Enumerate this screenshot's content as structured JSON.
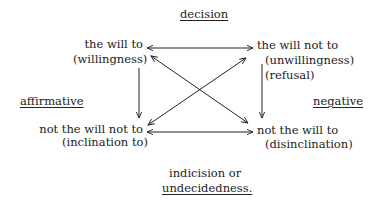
{
  "diagram": {
    "top_label": "decision",
    "left_label": "affirmative",
    "right_label": "negative",
    "bottom_label_line1": "indicision or",
    "bottom_label_line2": "undecidedness.",
    "nodes": {
      "top_left": {
        "line1": "the will to",
        "line2": "(willingness)"
      },
      "top_right": {
        "line1": "the will not to",
        "line2": "(unwillingness)",
        "line3": "(refusal)"
      },
      "bottom_left": {
        "line1": "not the will not to",
        "line2": "(inclination to)"
      },
      "bottom_right": {
        "line1": "not the will to",
        "line2": "(disinclination)"
      }
    },
    "edges": [
      {
        "from": "top_left",
        "to": "top_right",
        "type": "bidirectional"
      },
      {
        "from": "bottom_left",
        "to": "bottom_right",
        "type": "bidirectional"
      },
      {
        "from": "top_left",
        "to": "bottom_left",
        "type": "directed"
      },
      {
        "from": "top_right",
        "to": "bottom_right",
        "type": "directed"
      },
      {
        "from": "top_left",
        "to": "bottom_right",
        "type": "bidirectional"
      },
      {
        "from": "bottom_left",
        "to": "top_right",
        "type": "bidirectional"
      }
    ],
    "colors": {
      "ink": "#222222",
      "background": "#ffffff"
    }
  }
}
